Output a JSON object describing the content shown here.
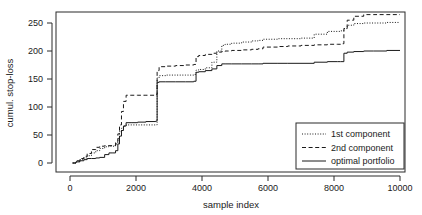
{
  "chart_data": {
    "type": "line",
    "title": "",
    "xlabel": "sample index",
    "ylabel": "cumul. stop-loss",
    "xlim": [
      0,
      10400
    ],
    "ylim": [
      -8,
      278
    ],
    "xticks": [
      0,
      2000,
      4000,
      6000,
      8000,
      10000
    ],
    "xtick_labels": [
      "0",
      "2000",
      "4000",
      "6000",
      "8000",
      "10000"
    ],
    "yticks": [
      0,
      50,
      100,
      150,
      200,
      250
    ],
    "ytick_labels": [
      "0",
      "50",
      "100",
      "150",
      "200",
      "250"
    ],
    "grid": false,
    "legend_position": "bottom-right",
    "step_style": "post",
    "series": [
      {
        "name": "1st component",
        "style": "dotted",
        "color": "#1a1a1a",
        "x": [
          80,
          180,
          300,
          420,
          520,
          650,
          780,
          900,
          1050,
          1180,
          1300,
          1380,
          1450,
          1500,
          1560,
          1620,
          1700,
          1850,
          2050,
          2300,
          2600,
          2640,
          2700,
          2900,
          3200,
          3500,
          3750,
          3820,
          3900,
          4100,
          4300,
          4450,
          4600,
          4700,
          4900,
          5200,
          5500,
          5700,
          5850,
          6000,
          6300,
          6600,
          7000,
          7400,
          7800,
          8100,
          8200,
          8300,
          8400,
          8600,
          8900,
          9200,
          9600,
          10000
        ],
        "y": [
          0,
          3,
          6,
          9,
          13,
          18,
          22,
          26,
          29,
          30,
          30,
          34,
          44,
          56,
          62,
          66,
          68,
          68,
          68,
          68,
          68,
          152,
          156,
          157,
          157,
          157,
          158,
          166,
          167,
          170,
          180,
          200,
          210,
          212,
          214,
          216,
          218,
          219,
          221,
          221,
          222,
          222,
          223,
          230,
          235,
          235,
          236,
          240,
          246,
          249,
          250,
          250,
          251,
          251
        ]
      },
      {
        "name": "2nd component",
        "style": "dashed",
        "color": "#1a1a1a",
        "x": [
          80,
          180,
          300,
          420,
          520,
          650,
          780,
          900,
          1050,
          1180,
          1300,
          1380,
          1450,
          1500,
          1560,
          1620,
          1700,
          1850,
          2050,
          2300,
          2600,
          2640,
          2700,
          2900,
          3200,
          3500,
          3750,
          3820,
          3900,
          4100,
          4300,
          4450,
          4600,
          4700,
          4900,
          5200,
          5500,
          5700,
          5850,
          6000,
          6300,
          6600,
          7000,
          7400,
          7800,
          8100,
          8200,
          8300,
          8400,
          8600,
          8900,
          9200,
          9600,
          10000
        ],
        "y": [
          0,
          4,
          8,
          12,
          17,
          24,
          28,
          30,
          31,
          31,
          31,
          38,
          52,
          68,
          92,
          110,
          121,
          121,
          121,
          121,
          122,
          165,
          172,
          173,
          174,
          175,
          176,
          190,
          192,
          194,
          196,
          198,
          199,
          200,
          201,
          202,
          203,
          204,
          207,
          207,
          208,
          209,
          210,
          211,
          212,
          212,
          213,
          240,
          255,
          262,
          265,
          265,
          265,
          265
        ]
      },
      {
        "name": "optimal portfolio",
        "style": "solid",
        "color": "#1a1a1a",
        "x": [
          80,
          180,
          300,
          420,
          520,
          650,
          780,
          900,
          1050,
          1180,
          1300,
          1380,
          1450,
          1500,
          1560,
          1620,
          1700,
          1850,
          2050,
          2300,
          2600,
          2640,
          2700,
          2900,
          3200,
          3500,
          3750,
          3820,
          3900,
          4100,
          4300,
          4450,
          4600,
          4700,
          4900,
          5200,
          5500,
          5700,
          5850,
          6000,
          6300,
          6600,
          7000,
          7400,
          7800,
          8100,
          8200,
          8300,
          8400,
          8600,
          8900,
          9200,
          9600,
          10000
        ],
        "y": [
          0,
          2,
          4,
          6,
          8,
          8,
          9,
          10,
          15,
          18,
          18,
          22,
          34,
          48,
          58,
          66,
          72,
          72,
          73,
          74,
          75,
          144,
          145,
          145,
          145,
          145,
          146,
          162,
          163,
          165,
          168,
          174,
          177,
          177,
          177,
          177,
          177,
          177,
          178,
          178,
          178,
          178,
          178,
          180,
          181,
          181,
          181,
          196,
          198,
          199,
          200,
          200,
          201,
          201
        ]
      }
    ]
  },
  "legend": {
    "entries": [
      {
        "label": "1st component",
        "style": "dotted"
      },
      {
        "label": "2nd component",
        "style": "dashed"
      },
      {
        "label": "optimal portfolio",
        "style": "solid"
      }
    ]
  }
}
